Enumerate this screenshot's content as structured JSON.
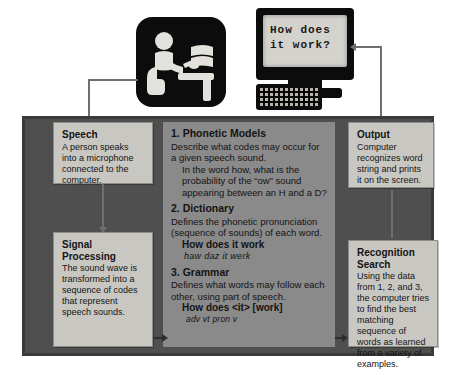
{
  "diagram": {
    "monitor_screen_text": "How does\nit work?",
    "icons": {
      "person": "person-at-desk-with-microphone-icon",
      "monitor": "computer-monitor-icon",
      "keyboard": "keyboard-icon"
    },
    "colors": {
      "panel_fill": "#4f4f4f",
      "panel_border": "#3a3a3a",
      "box_fill": "#c9c7c2",
      "box_border": "#8e8c88",
      "inner_panel": "#8a8a8a",
      "connector": "#6f6f6f",
      "text": "#141414",
      "screen": "#d4d2cd",
      "icon_dark": "#0c0c0c"
    },
    "boxes": {
      "speech": {
        "title": "Speech",
        "body": "A person speaks into a microphone connected to the computer."
      },
      "signal_processing": {
        "title": "Signal Processing",
        "body": "The sound wave is transformed into a sequence of codes that represent speech sounds."
      },
      "output": {
        "title": "Output",
        "body": "Computer recognizes word string and prints it on the screen."
      },
      "recognition_search": {
        "title": "Recognition Search",
        "body": "Using the data from 1, 2, and 3, the computer tries to find the best matching sequence of words as learned from a variety of examples."
      }
    },
    "models": {
      "phonetic": {
        "title": "1. Phonetic Models",
        "body": "Describe what codes may occur for a given speech sound.",
        "example": "In the word how, what is the probability of the “ow” sound appearing between an H and a D?"
      },
      "dictionary": {
        "title": "2. Dictionary",
        "body": "Defines the phonetic pronunciation (sequence of sounds) of each word.",
        "example_bold": "How does it work",
        "example_italic": "haw  daz   it  werk"
      },
      "grammar": {
        "title": "3. Grammar",
        "body": "Defines what words may follow each other, using part of speech.",
        "example_bold": "How does <it> [work]",
        "example_pos": "adv  vt     pron  v"
      }
    }
  }
}
